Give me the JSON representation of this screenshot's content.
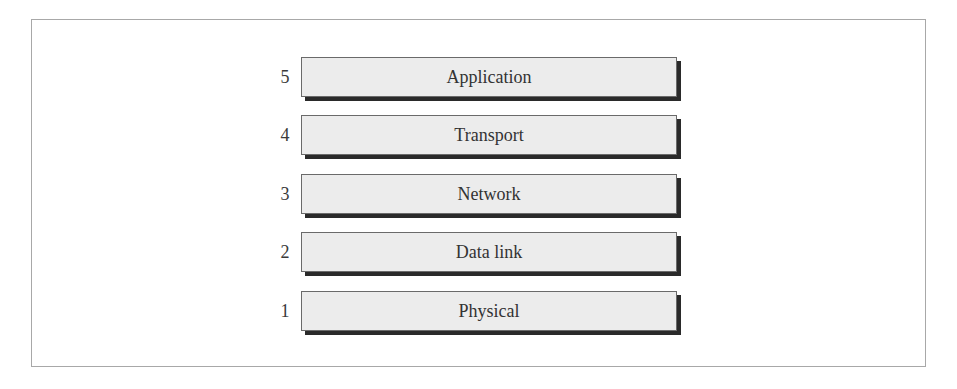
{
  "diagram": {
    "type": "layer-stack",
    "layers": [
      {
        "number": "5",
        "label": "Application"
      },
      {
        "number": "4",
        "label": "Transport"
      },
      {
        "number": "3",
        "label": "Network"
      },
      {
        "number": "2",
        "label": "Data link"
      },
      {
        "number": "1",
        "label": "Physical"
      }
    ]
  },
  "colors": {
    "box_fill": "#ececec",
    "box_border": "#6a6a6a",
    "shadow": "#2a2a2a",
    "frame_border": "#a8a8a8"
  }
}
